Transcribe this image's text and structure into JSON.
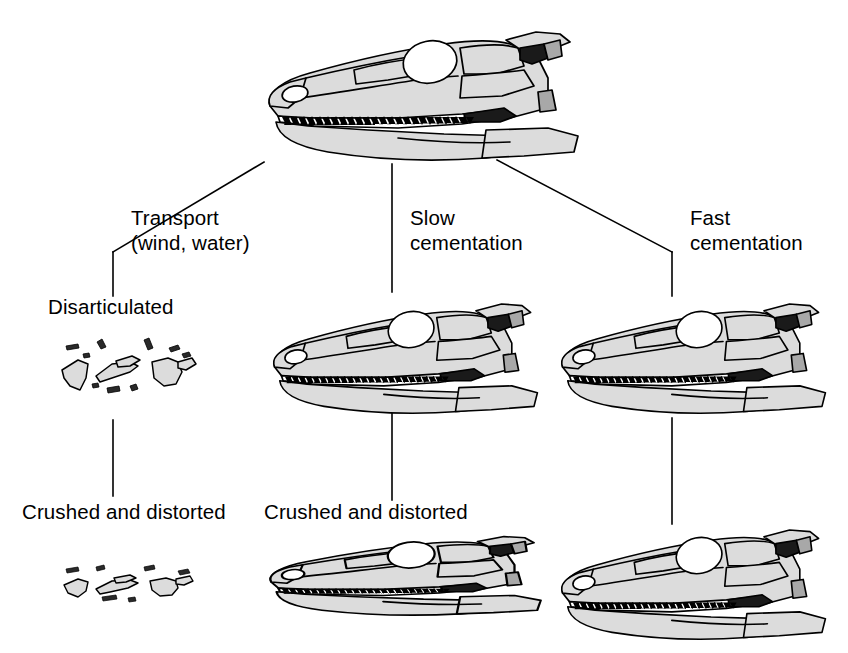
{
  "figure": {
    "background_color": "#ffffff",
    "width": 848,
    "height": 653
  },
  "palette": {
    "bone_fill": "#dcdcdc",
    "bone_fill_light": "#e4e4e4",
    "outline": "#000000",
    "fenestra_dark": "#1a1a1a",
    "fenestra_mid": "#a8a8a8",
    "orbit_white": "#ffffff",
    "tooth_white": "#ffffff",
    "text": "#000000"
  },
  "branches": [
    {
      "id": "transport",
      "process_label": "Transport\n(wind, water)",
      "stage1_label": "Disarticulated",
      "stage2_label": "Crushed and distorted",
      "stage1_kind": "fragments",
      "stage2_kind": "fragments-flattened"
    },
    {
      "id": "slow-cementation",
      "process_label": "Slow\ncementation",
      "stage1_label": "",
      "stage2_label": "Crushed and distorted",
      "stage1_kind": "skull-intact",
      "stage2_kind": "skull-crushed"
    },
    {
      "id": "fast-cementation",
      "process_label": "Fast\ncementation",
      "stage1_label": "",
      "stage2_label": "",
      "stage1_kind": "skull-intact",
      "stage2_kind": "skull-intact"
    }
  ],
  "source_specimen": {
    "label": "",
    "kind": "skull-intact",
    "description": "Complete articulated reptile skull in left lateral view with teeth, orbit and temporal fenestra"
  },
  "captions": {
    "transport_process": "Transport\n(wind, water)",
    "slow_process": "Slow\ncementation",
    "fast_process": "Fast\ncementation",
    "disarticulated": "Disarticulated",
    "crushed_left": "Crushed and distorted",
    "crushed_middle": "Crushed and distorted"
  }
}
